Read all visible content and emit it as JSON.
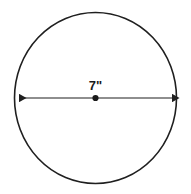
{
  "figure": {
    "type": "geometry-diagram",
    "shape": "circle",
    "background_color": "#ffffff",
    "stroke_color": "#1f1f1f",
    "label_color": "#1a1a1a",
    "circle": {
      "center_x": 95.5,
      "center_y": 98,
      "radius_x": 81,
      "radius_y": 85.5,
      "stroke_width": 1.6,
      "fill": "none"
    },
    "diameter": {
      "label": "7\"",
      "value": 7,
      "unit": "inches",
      "unit_symbol": "\"",
      "label_x": 95.5,
      "label_y": 90,
      "line_y": 98,
      "x_start": 15,
      "x_end": 176,
      "stroke_width": 1.2,
      "arrow_both_ends": true
    },
    "center_point": {
      "x": 95.5,
      "y": 98,
      "radius": 3.1,
      "color": "#1a1a1a"
    }
  },
  "chart_data": {
    "type": "diagram",
    "shape": "circle",
    "annotations": [
      {
        "name": "diameter",
        "text": "7\"",
        "value": 7,
        "unit": "in",
        "from": "left-edge",
        "to": "right-edge",
        "through": "center"
      }
    ],
    "markers": [
      {
        "name": "center-point",
        "symbol": "filled-dot"
      }
    ],
    "xlabel": "",
    "ylabel": "",
    "legend": []
  }
}
